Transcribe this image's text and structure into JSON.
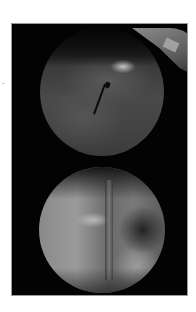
{
  "figure": {
    "panels": [
      {
        "position": "top",
        "features": [
          "bright crescent at upper right",
          "bright spot near center",
          "dark arrow pointing to bright spot"
        ]
      },
      {
        "position": "bottom",
        "features": [
          "vertical ridge through center",
          "bright spot left of center",
          "dark region at right"
        ]
      }
    ],
    "colors": {
      "background": "#ffffff",
      "panel": "#030303",
      "border": "#9a9a9a"
    }
  }
}
